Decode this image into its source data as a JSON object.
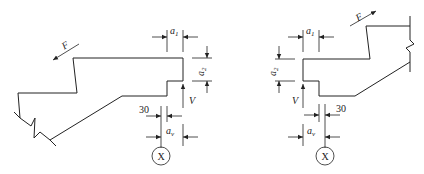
{
  "diagram": {
    "type": "corbel-detail",
    "left_figure": {
      "force_label": "F",
      "dim_a1": {
        "base": "a",
        "sub": "1"
      },
      "dim_a2": {
        "base": "a",
        "sub": "2"
      },
      "load_label": "V",
      "offset_label": "30",
      "dim_av": {
        "base": "a",
        "sub": "v"
      },
      "section_marker": "X"
    },
    "right_figure": {
      "force_label": "F",
      "dim_a1": {
        "base": "a",
        "sub": "1"
      },
      "dim_a2": {
        "base": "a",
        "sub": "2"
      },
      "load_label": "V",
      "offset_label": "30",
      "dim_av": {
        "base": "a",
        "sub": "v"
      },
      "section_marker": "X"
    },
    "colors": {
      "line": "#222222",
      "background": "#ffffff"
    }
  }
}
